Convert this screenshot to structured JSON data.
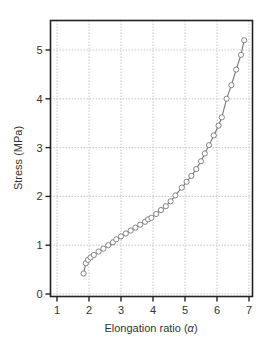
{
  "chart_data": {
    "type": "line",
    "title": "",
    "xlabel": "Elongation ratio (α)",
    "xlabel_main": "Elongation ratio (",
    "xlabel_symbol": "α",
    "xlabel_end": ")",
    "ylabel": "Stress (MPa)",
    "xlim": [
      0.85,
      7.1
    ],
    "ylim": [
      -0.1,
      5.6
    ],
    "xticks": [
      1,
      2,
      3,
      4,
      5,
      6,
      7
    ],
    "yticks": [
      0,
      1,
      2,
      3,
      4,
      5
    ],
    "grid": true,
    "legend": null,
    "series": [
      {
        "name": "Stress-strain",
        "marker": "open-circle",
        "line": "solid",
        "color": "#777777",
        "x": [
          1.83,
          1.9,
          1.97,
          2.05,
          2.15,
          2.3,
          2.45,
          2.6,
          2.75,
          2.85,
          3.0,
          3.15,
          3.3,
          3.45,
          3.6,
          3.75,
          3.85,
          3.95,
          4.1,
          4.25,
          4.4,
          4.55,
          4.7,
          4.9,
          5.05,
          5.2,
          5.35,
          5.5,
          5.62,
          5.75,
          5.9,
          6.05,
          6.15,
          6.3,
          6.45,
          6.6,
          6.75,
          6.85
        ],
        "y": [
          0.42,
          0.63,
          0.7,
          0.75,
          0.8,
          0.87,
          0.93,
          1.0,
          1.06,
          1.12,
          1.18,
          1.24,
          1.3,
          1.36,
          1.42,
          1.48,
          1.53,
          1.56,
          1.64,
          1.72,
          1.8,
          1.9,
          2.02,
          2.18,
          2.3,
          2.42,
          2.56,
          2.72,
          2.88,
          3.05,
          3.25,
          3.45,
          3.62,
          4.0,
          4.28,
          4.6,
          4.9,
          5.2
        ]
      }
    ]
  },
  "colors": {
    "axis": "#222222",
    "grid": "#b8b8b8",
    "series": "#777777",
    "text": "#333333"
  }
}
